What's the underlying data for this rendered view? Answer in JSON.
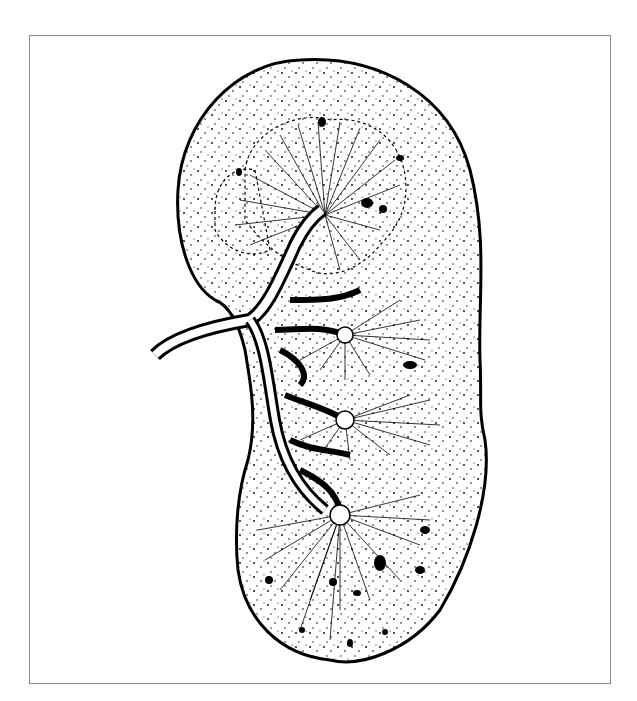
{
  "figure": {
    "style": "black-and-white pen-and-ink anatomical illustration",
    "frame_color": "#8a8a8a",
    "ink_color": "#000000",
    "background_color": "#ffffff",
    "elements": [
      "kidney-outline",
      "cortex-stippling",
      "renal-pyramids",
      "renal-artery",
      "arterial-branches",
      "cortical-dots"
    ],
    "caption_visible_text": ""
  }
}
